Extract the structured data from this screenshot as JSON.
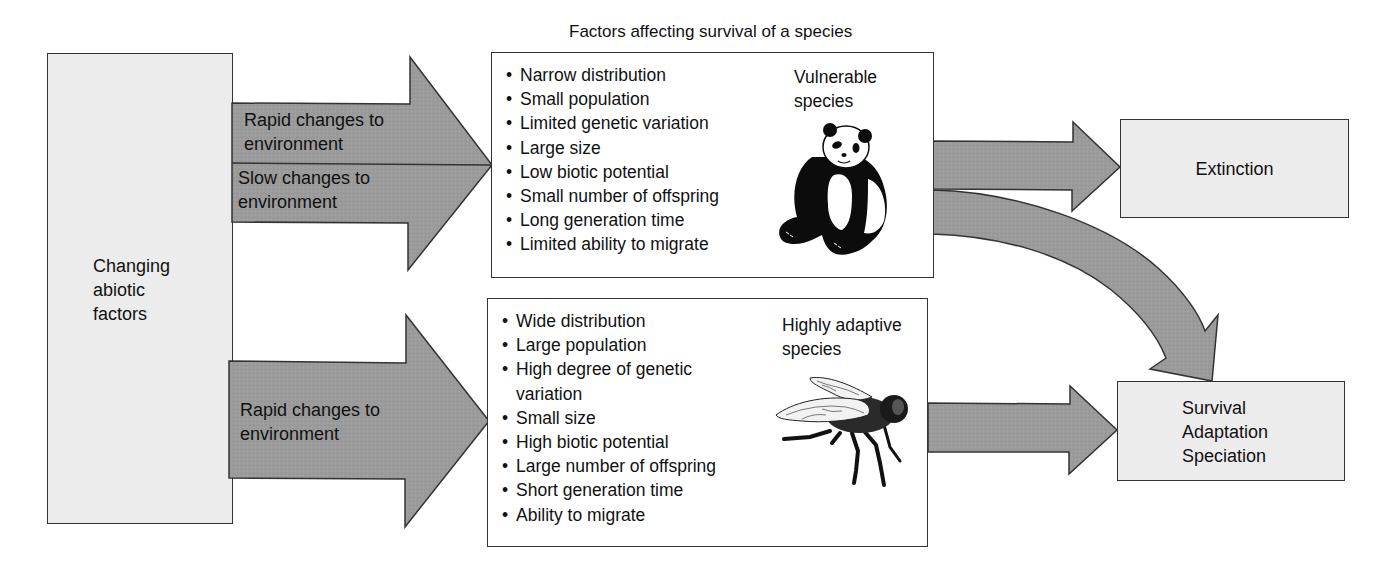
{
  "title": "Factors affecting survival of a species",
  "source_box": {
    "label": "Changing\nabiotic\nfactors"
  },
  "arrows": {
    "top_upper": {
      "label": "Rapid changes to\nenvironment"
    },
    "top_lower": {
      "label": "Slow changes to\nenvironment"
    },
    "bottom": {
      "label": "Rapid changes to\nenvironment"
    }
  },
  "vulnerable_box": {
    "heading": "Vulnerable\nspecies",
    "icon": "panda-icon",
    "factors": [
      "Narrow distribution",
      "Small population",
      "Limited genetic variation",
      "Large size",
      "Low biotic potential",
      "Small number of offspring",
      "Long generation time",
      "Limited ability to migrate"
    ]
  },
  "adaptive_box": {
    "heading": "Highly adaptive\nspecies",
    "icon": "fly-icon",
    "factors": [
      "Wide distribution",
      "Large population",
      "High degree of genetic\nvariation",
      "Small size",
      "High biotic potential",
      "Large number of offspring",
      "Short generation time",
      "Ability to migrate"
    ]
  },
  "outcomes": {
    "extinction": {
      "label": "Extinction"
    },
    "survival": {
      "label": "Survival\nAdaptation\nSpeciation"
    }
  },
  "colors": {
    "arrow_fill": "#9a9a9a",
    "box_gray": "#ececec",
    "stroke": "#333333"
  }
}
